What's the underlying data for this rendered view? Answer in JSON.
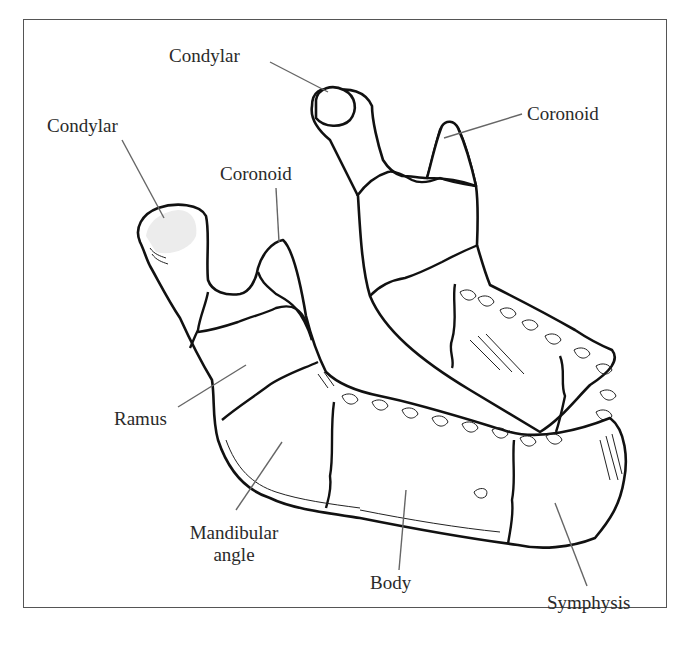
{
  "figure": {
    "line_color": "#111111",
    "leader_color": "#666666",
    "background": "#ffffff"
  },
  "labels": {
    "condylar_back": "Condylar",
    "condylar_front": "Condylar",
    "coronoid_back": "Coronoid",
    "coronoid_front": "Coronoid",
    "ramus": "Ramus",
    "mandibular_angle_line1": "Mandibular",
    "mandibular_angle_line2": "angle",
    "body": "Body",
    "symphysis": "Symphysis"
  }
}
